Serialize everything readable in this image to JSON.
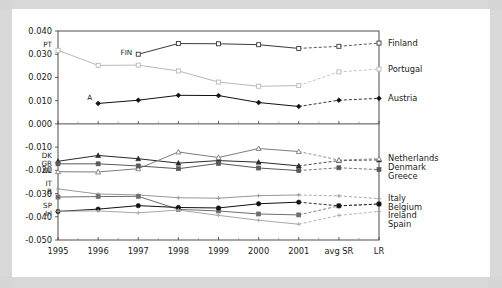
{
  "chart_data": {
    "type": "line",
    "title": "",
    "subtitle": "",
    "xlabel": "",
    "ylabel": "",
    "grid": false,
    "legend_position": "right-inline-labels",
    "x": [
      "1995",
      "1996",
      "1997",
      "1998",
      "1999",
      "2000",
      "2001",
      "avg SR",
      "LR"
    ],
    "ylim": [
      -0.05,
      0.04
    ],
    "yticks": [
      "0.040",
      "0.030",
      "0.020",
      "0.010",
      "0.000",
      "-0.010",
      "-0.020",
      "-0.030",
      "-0.040",
      "-0.050"
    ],
    "ytick_values": [
      0.04,
      0.03,
      0.02,
      0.01,
      0.0,
      -0.01,
      -0.02,
      -0.03,
      -0.04,
      -0.05
    ],
    "zero_divider": 0.0,
    "panels": [
      {
        "name": "upper-panel",
        "range": [
          0.0,
          0.04
        ],
        "series": [
          {
            "name": "Portugal",
            "inline_label": "PT",
            "right_label": "Portugal",
            "color": "#b9b9b9",
            "marker": "square-open",
            "x": [
              "1995",
              "1996",
              "1997",
              "1998",
              "1999",
              "2000",
              "2001",
              "avg SR",
              "LR"
            ],
            "values": [
              0.0317,
              0.0252,
              0.0253,
              0.0228,
              0.018,
              0.0162,
              0.0165,
              0.0224,
              0.0236
            ],
            "dashed_from": "2001"
          },
          {
            "name": "Finland",
            "inline_label": "FIN",
            "right_label": "Finland",
            "color": "#3a3a3a",
            "marker": "square-open",
            "x": [
              "1997",
              "1998",
              "1999",
              "2000",
              "2001",
              "avg SR",
              "LR"
            ],
            "values": [
              0.03,
              0.0346,
              0.0345,
              0.0341,
              0.0325,
              0.0334,
              0.0348
            ],
            "dashed_from": "2001"
          },
          {
            "name": "Austria",
            "inline_label": "A",
            "right_label": "Austria",
            "color": "#111111",
            "marker": "diamond-filled",
            "x": [
              "1996",
              "1997",
              "1998",
              "1999",
              "2000",
              "2001",
              "avg SR",
              "LR"
            ],
            "values": [
              0.0088,
              0.0102,
              0.0123,
              0.0122,
              0.0092,
              0.0075,
              0.0102,
              0.011
            ],
            "dashed_from": "2001"
          }
        ]
      },
      {
        "name": "lower-panel",
        "range": [
          -0.05,
          0.0
        ],
        "series": [
          {
            "name": "Denmark",
            "inline_label": "DK",
            "right_label": "Denmark",
            "color": "#2a2a2a",
            "marker": "triangle-filled",
            "x": [
              "1995",
              "1996",
              "1997",
              "1998",
              "1999",
              "2000",
              "2001",
              "avg SR",
              "LR"
            ],
            "values": [
              -0.0161,
              -0.0136,
              -0.015,
              -0.0169,
              -0.0158,
              -0.0165,
              -0.0181,
              -0.0158,
              -0.0155
            ],
            "dashed_from": "2001"
          },
          {
            "name": "Netherlands",
            "inline_label": "NL",
            "right_label": "Netherlands",
            "color": "#7d7d7d",
            "marker": "triangle-open",
            "x": [
              "1995",
              "1996",
              "1997",
              "1998",
              "1999",
              "2000",
              "2001",
              "avg SR",
              "LR"
            ],
            "values": [
              -0.0206,
              -0.0207,
              -0.0193,
              -0.0121,
              -0.0145,
              -0.0106,
              -0.0119,
              -0.0156,
              -0.015
            ],
            "dashed_from": "2001"
          },
          {
            "name": "Greece",
            "inline_label": "GR",
            "right_label": "Greece",
            "color": "#5a5a5a",
            "marker": "square-filled",
            "x": [
              "1995",
              "1996",
              "1997",
              "1998",
              "1999",
              "2000",
              "2001",
              "avg SR",
              "LR"
            ],
            "values": [
              -0.0172,
              -0.0172,
              -0.0181,
              -0.0193,
              -0.017,
              -0.019,
              -0.0201,
              -0.0189,
              -0.0197
            ],
            "dashed_from": "2001"
          },
          {
            "name": "Italy",
            "inline_label": "IT",
            "right_label": "Italy",
            "color": "#9a9a9a",
            "marker": "plus-open",
            "x": [
              "1995",
              "1996",
              "1997",
              "1998",
              "1999",
              "2000",
              "2001",
              "avg SR",
              "LR"
            ],
            "values": [
              -0.028,
              -0.0302,
              -0.0306,
              -0.0318,
              -0.032,
              -0.0309,
              -0.0306,
              -0.031,
              -0.0322
            ],
            "dashed_from": "2001"
          },
          {
            "name": "Belgium",
            "inline_label": "B",
            "right_label": "Belgium",
            "color": "#6e6e6e",
            "marker": "square-filled",
            "x": [
              "1995",
              "1996",
              "1997",
              "1998",
              "1999",
              "2000",
              "2001",
              "avg SR",
              "LR"
            ],
            "values": [
              -0.0315,
              -0.0313,
              -0.0312,
              -0.0368,
              -0.0375,
              -0.0388,
              -0.0392,
              -0.0353,
              -0.0345
            ],
            "dashed_from": "2001"
          },
          {
            "name": "Ireland",
            "inline_label": "Irl",
            "right_label": "Ireland",
            "color": "#111111",
            "marker": "circle-filled",
            "x": [
              "1995",
              "1996",
              "1997",
              "1998",
              "1999",
              "2000",
              "2001",
              "avg SR",
              "LR"
            ],
            "values": [
              -0.0377,
              -0.0367,
              -0.0352,
              -0.036,
              -0.0362,
              -0.0344,
              -0.0337,
              -0.0353,
              -0.0345
            ],
            "dashed_from": "2001"
          },
          {
            "name": "Spain",
            "inline_label": "SP",
            "right_label": "Spain",
            "color": "#a8a8a8",
            "marker": "plus-open",
            "x": [
              "1995",
              "1996",
              "1997",
              "1998",
              "1999",
              "2000",
              "2001",
              "avg SR",
              "LR"
            ],
            "values": [
              -0.0376,
              -0.0375,
              -0.0383,
              -0.0371,
              -0.0394,
              -0.0415,
              -0.0432,
              -0.0394,
              -0.0377
            ],
            "dashed_from": "2001"
          }
        ]
      }
    ]
  }
}
